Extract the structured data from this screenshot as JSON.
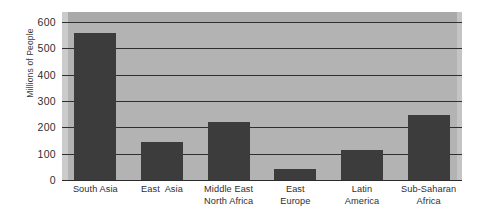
{
  "chart_data": {
    "type": "bar",
    "title": "",
    "subtitle": "",
    "xlabel": "",
    "ylabel": "Millions of People",
    "categories": [
      "South Asia",
      "East  Asia",
      "Middle East\nNorth Africa",
      "East\nEurope",
      "Latin\nAmerica",
      "Sub-Saharan\nAfrica"
    ],
    "values": [
      560,
      145,
      220,
      40,
      115,
      248
    ],
    "ylim": [
      0,
      600
    ],
    "yticks": [
      0,
      100,
      200,
      300,
      400,
      500,
      600
    ],
    "ytick_labels": [
      "0",
      "100",
      "200",
      "300",
      "400",
      "500",
      "600"
    ],
    "grid": true,
    "grid_axis": "y",
    "legend": false,
    "legend_position": "none",
    "bar_color": "#3c3c3c",
    "plot_background": "#b3b3b3",
    "gridline_color": "#2f2f2f",
    "axis_color": "#2b2b2b",
    "figure_background": "#ffffff"
  },
  "axis": {
    "y_title": "Millions of People",
    "ticks": [
      {
        "label": "600",
        "value": 600
      },
      {
        "label": "500",
        "value": 500
      },
      {
        "label": "400",
        "value": 400
      },
      {
        "label": "300",
        "value": 300
      },
      {
        "label": "200",
        "value": 200
      },
      {
        "label": "100",
        "value": 100
      },
      {
        "label": "0",
        "value": 0
      }
    ]
  },
  "bars": [
    {
      "label_line1": "South Asia",
      "label_line2": "",
      "value": 560
    },
    {
      "label_line1": "East  Asia",
      "label_line2": "",
      "value": 145
    },
    {
      "label_line1": "Middle East",
      "label_line2": "North Africa",
      "value": 220
    },
    {
      "label_line1": "East",
      "label_line2": "Europe",
      "value": 40
    },
    {
      "label_line1": "Latin",
      "label_line2": "America",
      "value": 115
    },
    {
      "label_line1": "Sub-Saharan",
      "label_line2": "Africa",
      "value": 248
    }
  ]
}
